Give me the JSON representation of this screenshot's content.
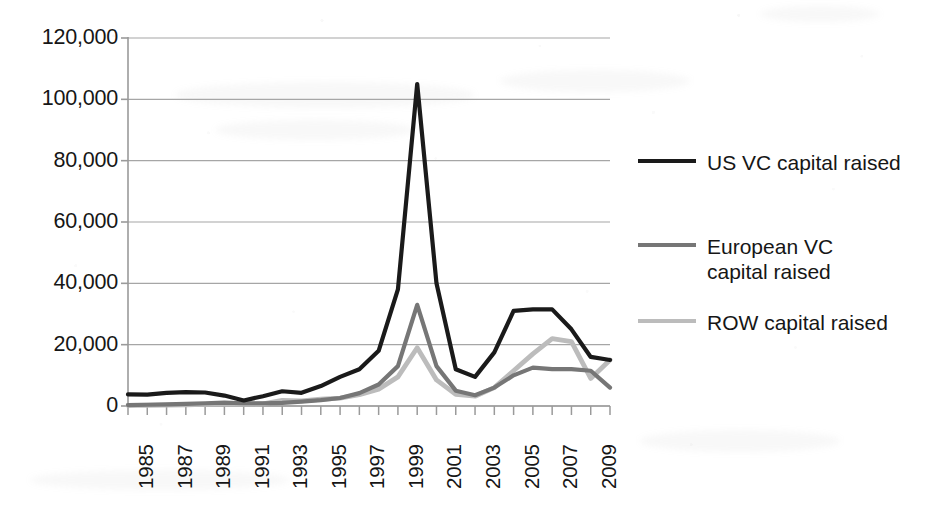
{
  "chart_data": {
    "type": "line",
    "title": "",
    "subtitle": "",
    "xlabel": "",
    "ylabel": "",
    "x": [
      1985,
      1986,
      1987,
      1988,
      1989,
      1990,
      1991,
      1992,
      1993,
      1994,
      1995,
      1996,
      1997,
      1998,
      1999,
      2000,
      2001,
      2002,
      2003,
      2004,
      2005,
      2006,
      2007,
      2008,
      2009,
      2010
    ],
    "categories": [
      "1985",
      "1986",
      "1987",
      "1988",
      "1989",
      "1990",
      "1991",
      "1992",
      "1993",
      "1994",
      "1995",
      "1996",
      "1997",
      "1998",
      "1999",
      "2000",
      "2001",
      "2002",
      "2003",
      "2004",
      "2005",
      "2006",
      "2007",
      "2008",
      "2009",
      "2010"
    ],
    "tick_labels_shown": [
      "1985",
      "1987",
      "1989",
      "1991",
      "1993",
      "1995",
      "1997",
      "1999",
      "2001",
      "2003",
      "2005",
      "2007",
      "2009"
    ],
    "series": [
      {
        "name": "US VC capital raised",
        "color": "#1a1a1a",
        "width": 4.2,
        "values": [
          3800,
          3700,
          4300,
          4500,
          4400,
          3400,
          1800,
          3200,
          4800,
          4300,
          6500,
          9500,
          12000,
          18000,
          38000,
          105000,
          40000,
          12000,
          9500,
          17500,
          31000,
          31500,
          31500,
          25000,
          16000,
          15000
        ]
      },
      {
        "name": "European VC capital raised",
        "color": "#767676",
        "width": 4.2,
        "values": [
          300,
          400,
          500,
          700,
          900,
          1100,
          900,
          900,
          1000,
          1400,
          1900,
          2600,
          4200,
          7000,
          13000,
          33000,
          13000,
          5000,
          3500,
          6000,
          10000,
          12500,
          12000,
          12000,
          11500,
          6000
        ]
      },
      {
        "name": "ROW capital raised",
        "color": "#bcbcbc",
        "width": 4.8,
        "values": [
          200,
          250,
          300,
          400,
          500,
          700,
          600,
          700,
          1800,
          1700,
          2200,
          2600,
          3700,
          5500,
          9500,
          19000,
          8500,
          3800,
          3200,
          6000,
          11500,
          17000,
          22000,
          21000,
          9000,
          15000
        ]
      }
    ],
    "ylim": [
      0,
      120000
    ],
    "yticks": [
      0,
      20000,
      40000,
      60000,
      80000,
      100000,
      120000
    ],
    "ytick_labels": [
      "0",
      "20,000",
      "40,000",
      "60,000",
      "80,000",
      "100,000",
      "120,000"
    ],
    "xlim": [
      1985,
      2010
    ],
    "grid": "horizontal",
    "legend_position": "right"
  },
  "legend": {
    "entries": [
      {
        "label": "US VC capital raised",
        "color": "#1a1a1a"
      },
      {
        "label": "European VC\ncapital raised",
        "color": "#767676"
      },
      {
        "label": "ROW capital raised",
        "color": "#bcbcbc"
      }
    ]
  },
  "axes": {
    "y_tick_labels": [
      "120,000",
      "100,000",
      "80,000",
      "60,000",
      "40,000",
      "20,000",
      "0"
    ],
    "x_tick_labels": [
      "1985",
      "1987",
      "1989",
      "1991",
      "1993",
      "1995",
      "1997",
      "1999",
      "2001",
      "2003",
      "2005",
      "2007",
      "2009"
    ]
  },
  "style": {
    "background": "#ffffff",
    "axis_color": "#9a9a9a",
    "gridline_color": "#a6a6a6",
    "text_color": "#161616"
  }
}
